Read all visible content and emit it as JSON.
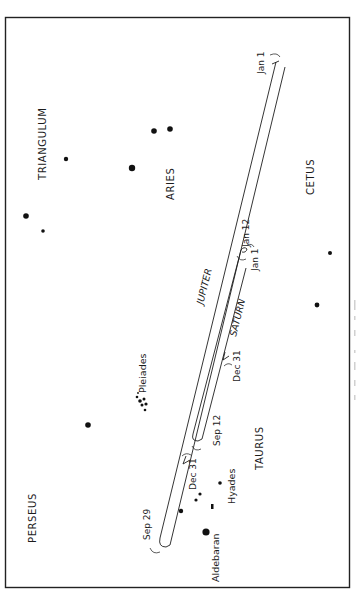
{
  "diagram": {
    "title": "",
    "orientation": "rotated-90-ccw",
    "frame": {
      "x": 5,
      "y": 17,
      "width": 345,
      "height": 571
    },
    "constellations": [
      {
        "name": "TRIANGULUM",
        "x": 46,
        "y": 148
      },
      {
        "name": "ARIES",
        "x": 171,
        "y": 195
      },
      {
        "name": "CETUS",
        "x": 318,
        "y": 180
      },
      {
        "name": "PERSEUS",
        "x": 36,
        "y": 530
      },
      {
        "name": "TAURUS",
        "x": 258,
        "y": 465
      }
    ],
    "star_labels": [
      {
        "name": "Pleiades",
        "x": 142,
        "y": 355
      },
      {
        "name": "Hyades",
        "x": 230,
        "y": 492
      },
      {
        "name": "Aldebaran",
        "x": 220,
        "y": 580
      }
    ],
    "planets": [
      {
        "name": "JUPITER",
        "label_x": 207,
        "label_y": 290
      },
      {
        "name": "SATURN",
        "label_x": 237,
        "label_y": 322
      }
    ],
    "dates": {
      "jupiter_jan1": "Jan 1",
      "jupiter_sep29": "Sep 29",
      "jupiter_dec31": "Dec 31",
      "saturn_jan1": "Jan 1",
      "saturn_jan12": "Jan 12",
      "saturn_sep12": "Sep 12",
      "saturn_dec31": "Dec 31"
    },
    "stars": [
      {
        "x": 66,
        "y": 159,
        "r": 2.2
      },
      {
        "x": 132,
        "y": 168,
        "r": 3.2
      },
      {
        "x": 154,
        "y": 131,
        "r": 2.8
      },
      {
        "x": 170,
        "y": 129,
        "r": 2.8
      },
      {
        "x": 26,
        "y": 216,
        "r": 2.8
      },
      {
        "x": 43,
        "y": 231,
        "r": 1.8
      },
      {
        "x": 88,
        "y": 425,
        "r": 2.8
      },
      {
        "x": 206,
        "y": 532,
        "r": 3.6
      },
      {
        "x": 181,
        "y": 511,
        "r": 2.2
      },
      {
        "x": 196,
        "y": 500,
        "r": 1.6
      },
      {
        "x": 200,
        "y": 494,
        "r": 1.6
      },
      {
        "x": 220,
        "y": 483,
        "r": 1.8
      },
      {
        "x": 317,
        "y": 305,
        "r": 2.4
      },
      {
        "x": 330,
        "y": 253,
        "r": 2.0
      }
    ],
    "pleiades_cluster": [
      {
        "x": 137,
        "y": 397,
        "r": 1.3
      },
      {
        "x": 140,
        "y": 401,
        "r": 1.8
      },
      {
        "x": 144,
        "y": 399,
        "r": 1.5
      },
      {
        "x": 142,
        "y": 405,
        "r": 1.5
      },
      {
        "x": 146,
        "y": 404,
        "r": 1.6
      },
      {
        "x": 145,
        "y": 410,
        "r": 1.3
      },
      {
        "x": 138,
        "y": 393,
        "r": 0.9
      }
    ],
    "caption": ""
  }
}
